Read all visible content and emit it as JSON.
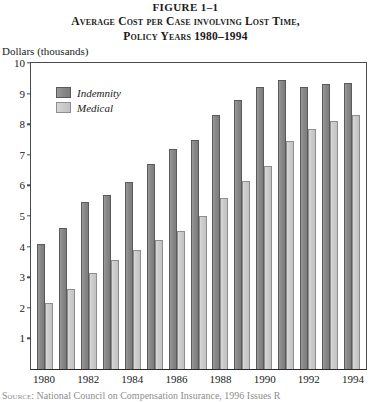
{
  "figure_number": "FIGURE 1–1",
  "title_line1": "Average Cost per Case involving Lost Time,",
  "title_line2": "Policy Years 1980–1994",
  "y_axis_label": "Dollars (thousands)",
  "source_label": "Source:",
  "source_text": "National Council on Compensation Insurance, 1996 Issues R",
  "legend": {
    "items": [
      {
        "label": "Indemnity",
        "color": "#8a8a8a"
      },
      {
        "label": "Medical",
        "color": "#cccccc"
      }
    ]
  },
  "colors": {
    "indemnity": "#8a8a8a",
    "medical": "#cccccc",
    "axis": "#4a4a4a",
    "background": "#ffffff"
  },
  "chart_data": {
    "type": "bar",
    "title": "Average Cost per Case involving Lost Time, Policy Years 1980–1994",
    "xlabel": "",
    "ylabel": "Dollars (thousands)",
    "ylim": [
      0,
      10
    ],
    "yticks": [
      0,
      1,
      2,
      3,
      4,
      5,
      6,
      7,
      8,
      9,
      10
    ],
    "ytick_labels": [
      "",
      "1",
      "2",
      "3",
      "4",
      "5",
      "6",
      "7",
      "8",
      "9",
      "10"
    ],
    "grid": false,
    "legend_position": "upper-left",
    "categories": [
      "1980",
      "1981",
      "1982",
      "1983",
      "1984",
      "1985",
      "1986",
      "1987",
      "1988",
      "1989",
      "1990",
      "1991",
      "1992",
      "1993",
      "1994"
    ],
    "xtick_labels": [
      "1980",
      "",
      "1982",
      "",
      "1984",
      "",
      "1986",
      "",
      "1988",
      "",
      "1990",
      "",
      "1992",
      "",
      "1994"
    ],
    "series": [
      {
        "name": "Indemnity",
        "values": [
          4.1,
          4.6,
          5.45,
          5.7,
          6.1,
          6.7,
          7.2,
          7.5,
          8.3,
          8.8,
          9.2,
          9.45,
          9.2,
          9.3,
          9.35
        ]
      },
      {
        "name": "Medical",
        "values": [
          2.15,
          2.6,
          3.15,
          3.55,
          3.9,
          4.2,
          4.5,
          5.0,
          5.6,
          6.15,
          6.65,
          7.45,
          7.85,
          8.1,
          8.3
        ]
      }
    ]
  }
}
